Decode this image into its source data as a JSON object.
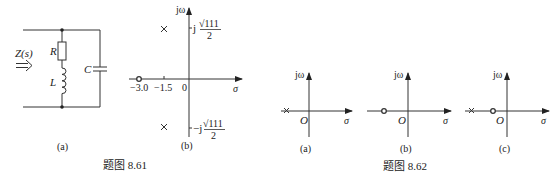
{
  "figure_861": {
    "caption": "题图 8.61",
    "a": {
      "label": "(a)",
      "impedance": "Z(s)",
      "resistor": "R",
      "inductor": "L",
      "capacitor": "C"
    },
    "b": {
      "label": "(b)",
      "y_axis": "jω",
      "x_axis": "σ",
      "ticks": [
        "−3.0",
        "−1.5",
        "0"
      ],
      "upper_pole_label": "j√111/2",
      "lower_pole_label": "−j√111/2",
      "upper_pole_prefix": "j",
      "lower_pole_prefix": "−j",
      "sqrt_num": "√111",
      "den": "2",
      "poles": [
        {
          "re": -1.5,
          "im": "+√111/2"
        },
        {
          "re": -1.5,
          "im": "−√111/2"
        }
      ],
      "zeros": [
        {
          "re": -3.0,
          "im": 0
        }
      ]
    }
  },
  "figure_862": {
    "caption": "题图 8.62",
    "panels": [
      {
        "label": "(a)",
        "y_axis": "jω",
        "x_axis": "σ",
        "origin": "O",
        "markers": [
          "pole on negative real axis"
        ]
      },
      {
        "label": "(b)",
        "y_axis": "jω",
        "x_axis": "σ",
        "origin": "O",
        "markers": [
          "zero on negative real axis"
        ]
      },
      {
        "label": "(c)",
        "y_axis": "jω",
        "x_axis": "σ",
        "origin": "O",
        "markers": [
          "pole on negative real axis",
          "zero on negative real axis"
        ]
      }
    ]
  }
}
